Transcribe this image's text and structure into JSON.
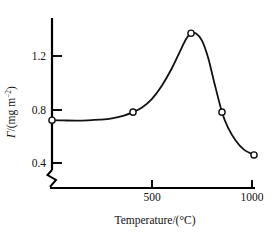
{
  "chart_data": {
    "type": "line",
    "title": "",
    "subtitle": "",
    "xlabel": "Temperature/(°C)",
    "ylabel": "Γ/(mg m⁻²)",
    "ylabel_symbol": "Γ",
    "ylabel_unit": "/(mg m",
    "ylabel_unit_sup": "−2",
    "ylabel_unit_close": ")",
    "xlim": [
      0,
      1050
    ],
    "ylim": [
      0.3,
      1.45
    ],
    "grid": false,
    "legend": null,
    "axis_break_y": true,
    "xticks": [
      500,
      1000
    ],
    "xtick_labels": [
      "500",
      "1000"
    ],
    "yticks": [
      0.4,
      0.8,
      1.2
    ],
    "ytick_labels": [
      "0.4",
      "0.8",
      "1.2"
    ],
    "marker": "open-circle",
    "series": [
      {
        "name": "surface-excess-vs-temperature",
        "x": [
          0,
          405,
          695,
          850,
          1010
        ],
        "y": [
          0.72,
          0.78,
          1.37,
          0.78,
          0.46
        ]
      }
    ],
    "curve_points": [
      [
        0,
        0.72
      ],
      [
        60,
        0.718
      ],
      [
        120,
        0.717
      ],
      [
        180,
        0.719
      ],
      [
        240,
        0.724
      ],
      [
        300,
        0.734
      ],
      [
        360,
        0.755
      ],
      [
        405,
        0.78
      ],
      [
        450,
        0.815
      ],
      [
        500,
        0.88
      ],
      [
        550,
        0.98
      ],
      [
        600,
        1.11
      ],
      [
        640,
        1.235
      ],
      [
        670,
        1.325
      ],
      [
        695,
        1.37
      ],
      [
        720,
        1.368
      ],
      [
        750,
        1.315
      ],
      [
        780,
        1.19
      ],
      [
        810,
        1.01
      ],
      [
        850,
        0.78
      ],
      [
        880,
        0.665
      ],
      [
        920,
        0.565
      ],
      [
        960,
        0.5
      ],
      [
        1010,
        0.46
      ]
    ],
    "colors": {
      "line": "#111111",
      "axis": "#000000",
      "marker_fill": "#ffffff",
      "marker_stroke": "#111111",
      "background": "#ffffff"
    }
  },
  "axis": {
    "x_title": "Temperature/(°C)",
    "y_title_symbol": "Γ",
    "y_title_rest": "/(mg m",
    "y_title_sup": "−2",
    "y_title_end": ")"
  },
  "ticks": {
    "y": [
      "1.2",
      "0.8",
      "0.4"
    ],
    "x": [
      "500",
      "1000"
    ]
  }
}
